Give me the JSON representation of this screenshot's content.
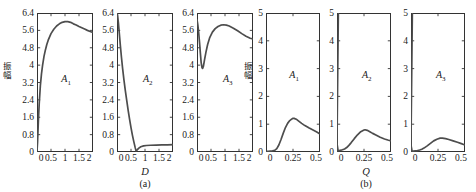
{
  "figure": {
    "width": 476,
    "height": 192,
    "background": "#ffffff",
    "curve_color": "#4d4d4d",
    "axis_color": "#333333"
  },
  "subfigures": [
    {
      "caption": "(a)",
      "ylabel": "振幅",
      "xlabel": "D",
      "xlim": [
        0,
        2
      ],
      "ylim": [
        0,
        6.4
      ],
      "xticks": [
        "0",
        "0.5",
        "1",
        "1.5",
        "2"
      ],
      "xtickvals": [
        0,
        0.5,
        1,
        1.5,
        2
      ],
      "yticks": [
        "0",
        "0.8",
        "1.6",
        "2.4",
        "3.2",
        "4",
        "4.8",
        "5.6",
        "6.4"
      ],
      "ytickvals": [
        0,
        0.8,
        1.6,
        2.4,
        3.2,
        4,
        4.8,
        5.6,
        6.4
      ],
      "panels": [
        "A1",
        "A2",
        "A3"
      ]
    },
    {
      "caption": "(b)",
      "ylabel": "振幅",
      "xlabel": "Q",
      "xlim": [
        0,
        0.5
      ],
      "ylim": [
        0,
        5
      ],
      "xticks": [
        "0",
        "0.25",
        "0.5"
      ],
      "xtickvals": [
        0,
        0.25,
        0.5
      ],
      "yticks": [
        "0",
        "1",
        "2",
        "3",
        "4",
        "5"
      ],
      "ytickvals": [
        0,
        1,
        2,
        3,
        4,
        5
      ],
      "panels": [
        "A1",
        "A2",
        "A3"
      ]
    }
  ],
  "labels": {
    "a1": "A",
    "a1sub": "1",
    "a2": "A",
    "a2sub": "2",
    "a3": "A",
    "a3sub": "3"
  },
  "chart_data": [
    {
      "type": "line",
      "title": "",
      "name": "a-A1",
      "xlabel": "D",
      "ylabel": "振幅",
      "xlim": [
        0,
        2
      ],
      "ylim": [
        0,
        6.4
      ],
      "grid": false,
      "legend": "none",
      "annotation": "A1",
      "x": [
        0,
        0.02,
        0.05,
        0.08,
        0.12,
        0.16,
        0.2,
        0.25,
        0.3,
        0.35,
        0.4,
        0.5,
        0.6,
        0.7,
        0.8,
        0.9,
        1.0,
        1.1,
        1.2,
        1.3,
        1.4,
        1.5,
        1.6,
        1.7,
        1.8,
        1.9,
        2.0
      ],
      "y": [
        0.05,
        0.45,
        1.45,
        2.25,
        3.05,
        3.6,
        4.0,
        4.4,
        4.7,
        4.95,
        5.15,
        5.45,
        5.65,
        5.8,
        5.9,
        5.97,
        6.0,
        6.0,
        5.97,
        5.9,
        5.85,
        5.78,
        5.72,
        5.66,
        5.6,
        5.55,
        5.5
      ]
    },
    {
      "type": "line",
      "name": "a-A2",
      "xlabel": "D",
      "ylabel": "振幅",
      "xlim": [
        0,
        2
      ],
      "ylim": [
        0,
        6.4
      ],
      "grid": false,
      "legend": "none",
      "annotation": "A2",
      "x": [
        0,
        0.02,
        0.05,
        0.08,
        0.12,
        0.16,
        0.2,
        0.25,
        0.3,
        0.35,
        0.4,
        0.45,
        0.5,
        0.55,
        0.6,
        0.65,
        0.68,
        0.72,
        0.78,
        0.85,
        0.95,
        1.05,
        1.2,
        1.4,
        1.6,
        1.8,
        2.0
      ],
      "y": [
        6.4,
        6.3,
        5.95,
        5.5,
        4.9,
        4.35,
        3.85,
        3.3,
        2.8,
        2.35,
        1.9,
        1.5,
        1.12,
        0.78,
        0.48,
        0.2,
        0.05,
        0.1,
        0.18,
        0.24,
        0.28,
        0.3,
        0.31,
        0.32,
        0.33,
        0.33,
        0.34
      ]
    },
    {
      "type": "line",
      "name": "a-A3",
      "xlabel": "D",
      "ylabel": "振幅",
      "xlim": [
        0,
        2
      ],
      "ylim": [
        0,
        6.4
      ],
      "grid": false,
      "legend": "none",
      "annotation": "A3",
      "x": [
        0,
        0.03,
        0.06,
        0.09,
        0.12,
        0.15,
        0.18,
        0.2,
        0.23,
        0.27,
        0.32,
        0.38,
        0.45,
        0.55,
        0.65,
        0.75,
        0.85,
        0.95,
        1.05,
        1.15,
        1.3,
        1.45,
        1.6,
        1.75,
        1.9,
        2.0
      ],
      "y": [
        6.1,
        5.85,
        5.5,
        5.05,
        4.55,
        4.1,
        3.88,
        3.85,
        3.95,
        4.25,
        4.6,
        4.95,
        5.25,
        5.52,
        5.68,
        5.78,
        5.84,
        5.86,
        5.84,
        5.8,
        5.7,
        5.58,
        5.45,
        5.33,
        5.24,
        5.2
      ]
    },
    {
      "type": "line",
      "name": "b-A1",
      "xlabel": "Q",
      "ylabel": "振幅",
      "xlim": [
        0,
        0.5
      ],
      "ylim": [
        0,
        5
      ],
      "grid": false,
      "legend": "none",
      "annotation": "A1",
      "x": [
        0,
        0.02,
        0.04,
        0.06,
        0.08,
        0.1,
        0.12,
        0.14,
        0.16,
        0.18,
        0.2,
        0.22,
        0.24,
        0.25,
        0.26,
        0.28,
        0.3,
        0.33,
        0.36,
        0.4,
        0.44,
        0.47,
        0.5
      ],
      "y": [
        0.02,
        0.02,
        0.03,
        0.04,
        0.06,
        0.12,
        0.26,
        0.46,
        0.68,
        0.88,
        1.03,
        1.13,
        1.19,
        1.21,
        1.21,
        1.18,
        1.12,
        1.03,
        0.95,
        0.86,
        0.78,
        0.72,
        0.65
      ]
    },
    {
      "type": "line",
      "name": "b-A2",
      "xlabel": "Q",
      "ylabel": "振幅",
      "xlim": [
        0,
        0.5
      ],
      "ylim": [
        0,
        5
      ],
      "grid": false,
      "legend": "none",
      "annotation": "A2",
      "spike": {
        "x": 0.006,
        "y_from": 0,
        "y_to": 5
      },
      "x": [
        0,
        0.01,
        0.02,
        0.03,
        0.05,
        0.07,
        0.09,
        0.11,
        0.13,
        0.16,
        0.19,
        0.22,
        0.25,
        0.26,
        0.28,
        0.3,
        0.33,
        0.36,
        0.4,
        0.44,
        0.47,
        0.5
      ],
      "y": [
        0.3,
        0.05,
        0.05,
        0.06,
        0.08,
        0.11,
        0.16,
        0.24,
        0.33,
        0.48,
        0.62,
        0.73,
        0.79,
        0.8,
        0.78,
        0.74,
        0.67,
        0.61,
        0.53,
        0.47,
        0.43,
        0.4
      ]
    },
    {
      "type": "line",
      "name": "b-A3",
      "xlabel": "Q",
      "ylabel": "振幅",
      "xlim": [
        0,
        0.5
      ],
      "ylim": [
        0,
        5
      ],
      "grid": false,
      "legend": "none",
      "annotation": "A3",
      "spike": {
        "x": 0.006,
        "y_from": 0,
        "y_to": 5
      },
      "x": [
        0,
        0.01,
        0.02,
        0.04,
        0.06,
        0.08,
        0.1,
        0.12,
        0.15,
        0.18,
        0.21,
        0.24,
        0.27,
        0.29,
        0.32,
        0.35,
        0.39,
        0.43,
        0.46,
        0.5
      ],
      "y": [
        0.25,
        0.03,
        0.03,
        0.04,
        0.05,
        0.07,
        0.1,
        0.14,
        0.22,
        0.31,
        0.4,
        0.46,
        0.5,
        0.5,
        0.48,
        0.45,
        0.4,
        0.35,
        0.31,
        0.25
      ]
    }
  ]
}
